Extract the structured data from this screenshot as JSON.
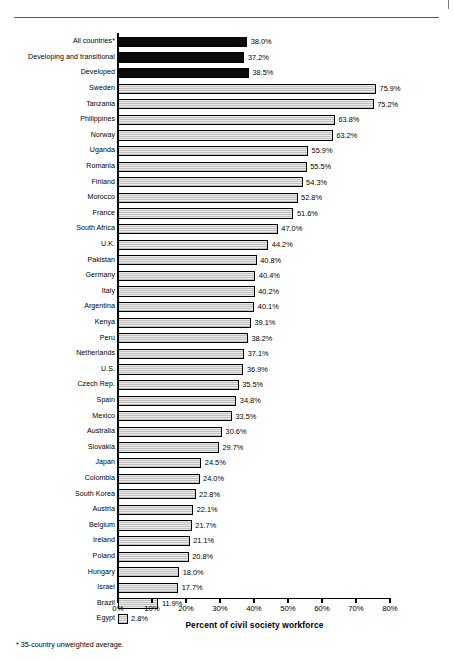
{
  "figure": {
    "axis_title": "Percent of civil society workforce",
    "footnote": "* 35-country unweighted average."
  },
  "chart_data": {
    "type": "bar",
    "orientation": "horizontal",
    "title": "",
    "subtitle": "",
    "xlabel": "Percent of civil society workforce",
    "ylabel": "",
    "xlim": [
      0,
      80
    ],
    "xticks": [
      "0%",
      "10%",
      "20%",
      "30%",
      "40%",
      "50%",
      "60%",
      "70%",
      "80%"
    ],
    "xtick_values": [
      0,
      10,
      20,
      30,
      40,
      50,
      60,
      70,
      80
    ],
    "grid": false,
    "legend": "none",
    "annotations": [
      "* 35-country unweighted average."
    ],
    "categories": [
      "All countries*",
      "Developing and transitional",
      "Developed",
      "Sweden",
      "Tanzania",
      "Philippines",
      "Norway",
      "Uganda",
      "Romania",
      "Finland",
      "Morocco",
      "France",
      "South Africa",
      "U.K.",
      "Pakistan",
      "Germany",
      "Italy",
      "Argentina",
      "Kenya",
      "Peru",
      "Netherlands",
      "U.S.",
      "Czech Rep.",
      "Spain",
      "Mexico",
      "Australia",
      "Slovakia",
      "Japan",
      "Colombia",
      "South Korea",
      "Austria",
      "Belgium",
      "Ireland",
      "Poland",
      "Hungary",
      "Israel",
      "Brazil",
      "Egypt"
    ],
    "values": [
      38.0,
      37.2,
      38.5,
      75.9,
      75.2,
      63.8,
      63.2,
      55.9,
      55.5,
      54.3,
      52.8,
      51.6,
      47.0,
      44.2,
      40.8,
      40.4,
      40.2,
      40.1,
      39.1,
      38.2,
      37.1,
      36.9,
      35.5,
      34.8,
      33.5,
      30.6,
      29.7,
      24.5,
      24.0,
      22.8,
      22.1,
      21.7,
      21.1,
      20.8,
      18.0,
      17.7,
      11.9,
      2.8
    ],
    "value_labels": [
      "38.0%",
      "37.2%",
      "38.5%",
      "75.9%",
      "75.2%",
      "63.8%",
      "63.2%",
      "55.9%",
      "55.5%",
      "54.3%",
      "52.8%",
      "51.6%",
      "47.0%",
      "44.2%",
      "40.8%",
      "40.4%",
      "40.2%",
      "40.1%",
      "39.1%",
      "38.2%",
      "37.1%",
      "36.9%",
      "35.5%",
      "34.8%",
      "33.5%",
      "30.6%",
      "29.7%",
      "24.5%",
      "24.0%",
      "22.8%",
      "22.1%",
      "21.7%",
      "21.1%",
      "20.8%",
      "18.0%",
      "17.7%",
      "11.9%",
      "2.8%"
    ],
    "bar_styles": [
      "dark",
      "dark",
      "dark",
      "light",
      "light",
      "light",
      "light",
      "light",
      "light",
      "light",
      "light",
      "light",
      "light",
      "light",
      "light",
      "light",
      "light",
      "light",
      "light",
      "light",
      "light",
      "light",
      "light",
      "light",
      "light",
      "light",
      "light",
      "light",
      "light",
      "light",
      "light",
      "light",
      "light",
      "light",
      "light",
      "light",
      "light",
      "light"
    ],
    "colors": {
      "dark_bar": "#0a0a0a",
      "light_bar": "#d2d2d2",
      "bar_outline": "#000000",
      "axis": "#000000",
      "text": "#000000"
    }
  }
}
